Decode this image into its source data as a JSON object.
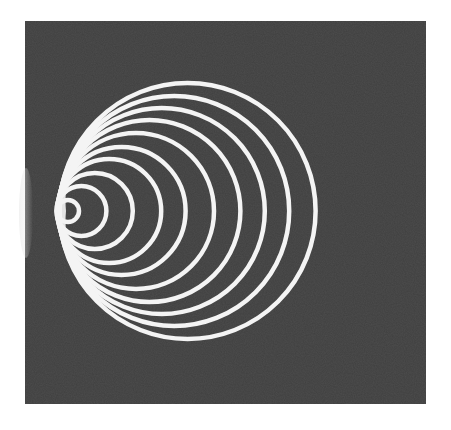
{
  "figure": {
    "background_color": "#4d4d4d",
    "line_color": "#f4f4f4",
    "panel": {
      "x": 25,
      "y": 21,
      "width": 401,
      "height": 383
    },
    "tangent_point": {
      "x": 56,
      "y": 211
    },
    "circle_radii": [
      11,
      25,
      38,
      52,
      64,
      78,
      91,
      103,
      115,
      128
    ],
    "stroke_width": 4.5
  }
}
